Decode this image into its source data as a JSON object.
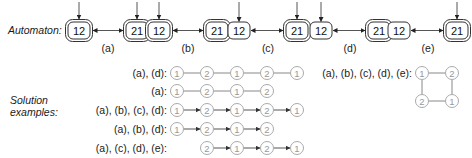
{
  "automaton_label": "Automaton:",
  "solution_label_line1": "Solution",
  "solution_label_line2": "examples:",
  "automata": [
    {
      "id": "a",
      "caption": "(a)",
      "states": [
        {
          "label": "12",
          "initial": true,
          "accepting": true
        },
        {
          "label": "21",
          "initial": true,
          "accepting": true
        }
      ]
    },
    {
      "id": "b",
      "caption": "(b)",
      "states": [
        {
          "label": "12",
          "initial": true,
          "accepting": true
        },
        {
          "label": "21",
          "initial": false,
          "accepting": true
        }
      ]
    },
    {
      "id": "c",
      "caption": "(c)",
      "states": [
        {
          "label": "12",
          "initial": true,
          "accepting": false
        },
        {
          "label": "21",
          "initial": true,
          "accepting": true
        }
      ]
    },
    {
      "id": "d",
      "caption": "(d)",
      "states": [
        {
          "label": "12",
          "initial": true,
          "accepting": false
        },
        {
          "label": "21",
          "initial": false,
          "accepting": true
        }
      ]
    },
    {
      "id": "e",
      "caption": "(e)",
      "states": [
        {
          "label": "12",
          "initial": false,
          "accepting": false
        },
        {
          "label": "21",
          "initial": true,
          "accepting": true
        }
      ]
    }
  ],
  "solutions": [
    {
      "label": "(a), (d):",
      "start_slot": 0,
      "nodes": [
        "1",
        "2",
        "1",
        "2",
        "1"
      ],
      "directed": false
    },
    {
      "label": "(a):",
      "start_slot": 0,
      "nodes": [
        "1",
        "2",
        "1",
        "2"
      ],
      "directed": false
    },
    {
      "label": "(a), (b), (c), (d):",
      "start_slot": 0,
      "nodes": [
        "1",
        "2",
        "1",
        "2",
        "1"
      ],
      "directed": true
    },
    {
      "label": "(a), (b), (d):",
      "start_slot": 0,
      "nodes": [
        "1",
        "2",
        "1",
        "2"
      ],
      "directed": true
    },
    {
      "label": "(a), (c), (d), (e):",
      "start_slot": 1,
      "nodes": [
        "2",
        "1",
        "2",
        "1"
      ],
      "directed": true
    }
  ],
  "cycle_solution": {
    "label": "(a), (b), (c), (d), (e):",
    "nodes": [
      "1",
      "2",
      "1",
      "2"
    ]
  }
}
